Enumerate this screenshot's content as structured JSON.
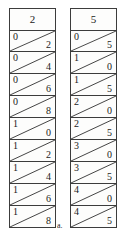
{
  "figure": {
    "label": "a.",
    "type": "napiers-bones",
    "border_color": "#3c3c3c",
    "cell_background": "#fdfdfc",
    "page_background": "#ffffff"
  },
  "rods": [
    {
      "name": "rod-2",
      "header": "2",
      "cells": [
        {
          "tens": "0",
          "ones": "2"
        },
        {
          "tens": "0",
          "ones": "4"
        },
        {
          "tens": "0",
          "ones": "6"
        },
        {
          "tens": "0",
          "ones": "8"
        },
        {
          "tens": "1",
          "ones": "0"
        },
        {
          "tens": "1",
          "ones": "2"
        },
        {
          "tens": "1",
          "ones": "4"
        },
        {
          "tens": "1",
          "ones": "6"
        },
        {
          "tens": "1",
          "ones": "8"
        }
      ]
    },
    {
      "name": "rod-5",
      "header": "5",
      "cells": [
        {
          "tens": "0",
          "ones": "5"
        },
        {
          "tens": "1",
          "ones": "0"
        },
        {
          "tens": "1",
          "ones": "5"
        },
        {
          "tens": "2",
          "ones": "0"
        },
        {
          "tens": "2",
          "ones": "5"
        },
        {
          "tens": "3",
          "ones": "0"
        },
        {
          "tens": "3",
          "ones": "5"
        },
        {
          "tens": "4",
          "ones": "0"
        },
        {
          "tens": "4",
          "ones": "5"
        }
      ]
    }
  ]
}
